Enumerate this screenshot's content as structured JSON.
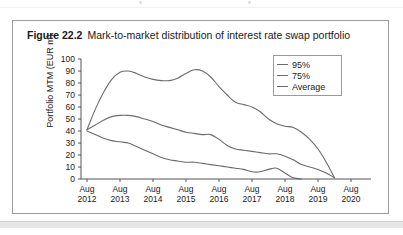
{
  "figure": {
    "number": "Figure 22.2",
    "title": "Mark-to-market distribution of interest rate swap portfolio"
  },
  "colors": {
    "line": "#6b6b6b",
    "axis": "#555555",
    "frame": "#9a9a9a",
    "text": "#1a1a1a",
    "footer_band": "#e6e6e6"
  },
  "chart_data": {
    "type": "line",
    "title": "Mark-to-market distribution of interest rate swap portfolio",
    "xlabel": "",
    "ylabel": "Portfolio MTM (EUR m)",
    "categories": [
      "Aug 2012",
      "Aug 2013",
      "Aug 2014",
      "Aug 2015",
      "Aug 2016",
      "Aug 2017",
      "Aug 2018",
      "Aug 2019",
      "Aug 2020"
    ],
    "x_tick_lines": [
      {
        "top": "Aug",
        "bottom": "2012"
      },
      {
        "top": "Aug",
        "bottom": "2013"
      },
      {
        "top": "Aug",
        "bottom": "2014"
      },
      {
        "top": "Aug",
        "bottom": "2015"
      },
      {
        "top": "Aug",
        "bottom": "2016"
      },
      {
        "top": "Aug",
        "bottom": "2017"
      },
      {
        "top": "Aug",
        "bottom": "2018"
      },
      {
        "top": "Aug",
        "bottom": "2019"
      },
      {
        "top": "Aug",
        "bottom": "2020"
      }
    ],
    "y_ticks": [
      0,
      10,
      20,
      30,
      40,
      50,
      60,
      70,
      80,
      90,
      100
    ],
    "ylim": [
      0,
      100
    ],
    "xlim": [
      2012,
      2020
    ],
    "grid": false,
    "legend_position": "top-right",
    "series": [
      {
        "name": "95%",
        "x": [
          2012.0,
          2012.25,
          2012.5,
          2012.75,
          2013.0,
          2013.25,
          2013.5,
          2013.75,
          2014.0,
          2014.25,
          2014.5,
          2014.75,
          2015.0,
          2015.25,
          2015.5,
          2015.75,
          2016.0,
          2016.25,
          2016.5,
          2016.75,
          2017.0,
          2017.25,
          2017.5,
          2017.75,
          2018.0,
          2018.25,
          2018.5,
          2018.75,
          2019.0,
          2019.25,
          2019.5
        ],
        "values": [
          41,
          58,
          72,
          83,
          89,
          90,
          88,
          85,
          83,
          82,
          82,
          84,
          88,
          91,
          90,
          85,
          77,
          70,
          64,
          62,
          60,
          56,
          50,
          46,
          44,
          43,
          39,
          33,
          25,
          14,
          1
        ]
      },
      {
        "name": "75%",
        "x": [
          2012.0,
          2012.25,
          2012.5,
          2012.75,
          2013.0,
          2013.25,
          2013.5,
          2013.75,
          2014.0,
          2014.25,
          2014.5,
          2014.75,
          2015.0,
          2015.25,
          2015.5,
          2015.75,
          2016.0,
          2016.25,
          2016.5,
          2016.75,
          2017.0,
          2017.25,
          2017.5,
          2017.75,
          2018.0,
          2018.25,
          2018.5,
          2018.75,
          2019.0,
          2019.25,
          2019.5
        ],
        "values": [
          41,
          45,
          49,
          52,
          53,
          53,
          52,
          50,
          48,
          45,
          43,
          41,
          39,
          38,
          37,
          37,
          33,
          28,
          25,
          24,
          23,
          22,
          21,
          21,
          19,
          16,
          12,
          10,
          8,
          5,
          1
        ]
      },
      {
        "name": "Average",
        "x": [
          2012.0,
          2012.25,
          2012.5,
          2012.75,
          2013.0,
          2013.25,
          2013.5,
          2013.75,
          2014.0,
          2014.25,
          2014.5,
          2014.75,
          2015.0,
          2015.25,
          2015.5,
          2015.75,
          2016.0,
          2016.25,
          2016.5,
          2016.75,
          2017.0,
          2017.25,
          2017.5,
          2017.75,
          2018.0,
          2018.25,
          2018.5
        ],
        "values": [
          40,
          37,
          34,
          32,
          31,
          30,
          27,
          24,
          21,
          18,
          16,
          15,
          14,
          14,
          13,
          12,
          11,
          10,
          9,
          8,
          6,
          6,
          8,
          9,
          5,
          1,
          0
        ]
      }
    ],
    "legend": [
      {
        "label": "95%"
      },
      {
        "label": "75%"
      },
      {
        "label": "Average"
      }
    ]
  }
}
